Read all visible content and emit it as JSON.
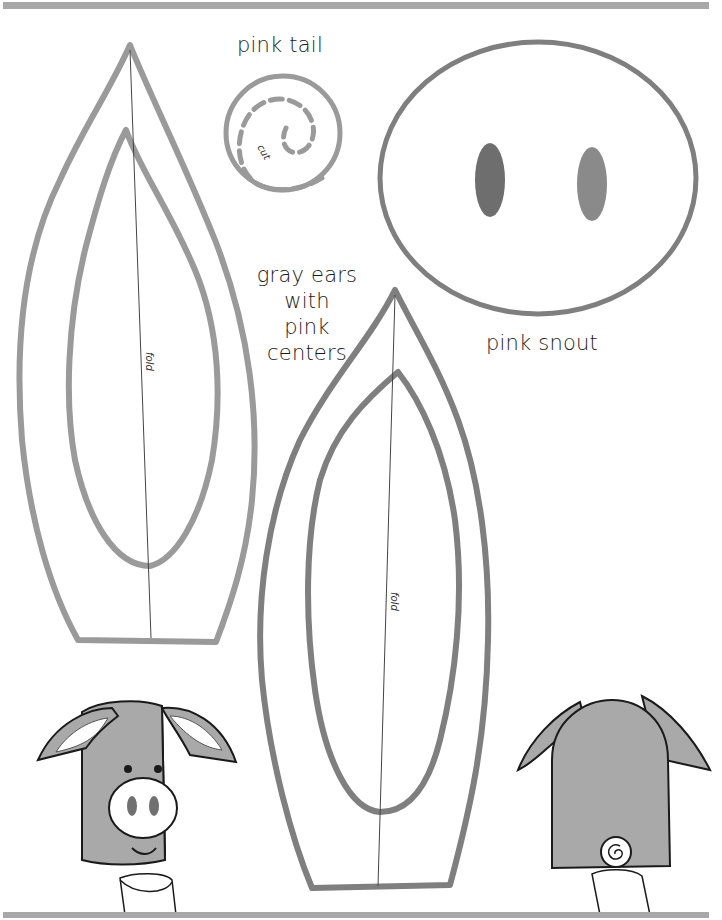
{
  "page": {
    "type": "printable craft template"
  },
  "labels": {
    "tail": "pink tail",
    "tail_cut": "cut",
    "snout": "pink snout",
    "ears": [
      "gray ears",
      "with",
      "pink",
      "centers"
    ],
    "fold_left": "fold",
    "fold_right": "fold"
  },
  "pieces": [
    {
      "name": "pink tail",
      "shape": "circle with dashed spiral cut line"
    },
    {
      "name": "pink snout",
      "shape": "oval with two nostrils"
    },
    {
      "name": "left ear",
      "shape": "teardrop with inner center outline and fold line"
    },
    {
      "name": "right ear",
      "shape": "teardrop with inner center outline and fold line"
    }
  ],
  "illustrations": [
    {
      "name": "pig puppet front",
      "features": [
        "ears",
        "eyes",
        "snout",
        "smile",
        "sweater cuff"
      ]
    },
    {
      "name": "pig puppet back",
      "features": [
        "ears",
        "curly tail",
        "sweater cuff"
      ]
    }
  ],
  "colors": {
    "outline_gray": "#9a9a9a",
    "outline_dark": "#7a7a7a",
    "puppet_fill": "#a9a9a9",
    "ink": "#1a1a1a",
    "bar": "#a8a8a8"
  }
}
